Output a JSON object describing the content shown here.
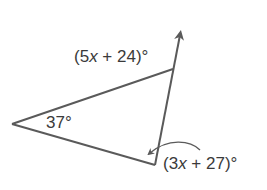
{
  "diagram": {
    "type": "triangle-exterior-angle",
    "colors": {
      "line": "#5a5a5a",
      "text": "#3a3a3a",
      "background": "#ffffff"
    },
    "vertices": {
      "left": [
        12,
        124
      ],
      "top": [
        173,
        69
      ],
      "bottom": [
        155,
        165
      ]
    },
    "ray_end": [
      181,
      28
    ],
    "labels": {
      "interior_angle": "37°",
      "exterior_angle": {
        "open": "(5",
        "var": "x",
        "rest": " + 24)°"
      },
      "bottom_angle": {
        "open": "(3",
        "var": "x",
        "rest": " + 27)°"
      }
    }
  }
}
